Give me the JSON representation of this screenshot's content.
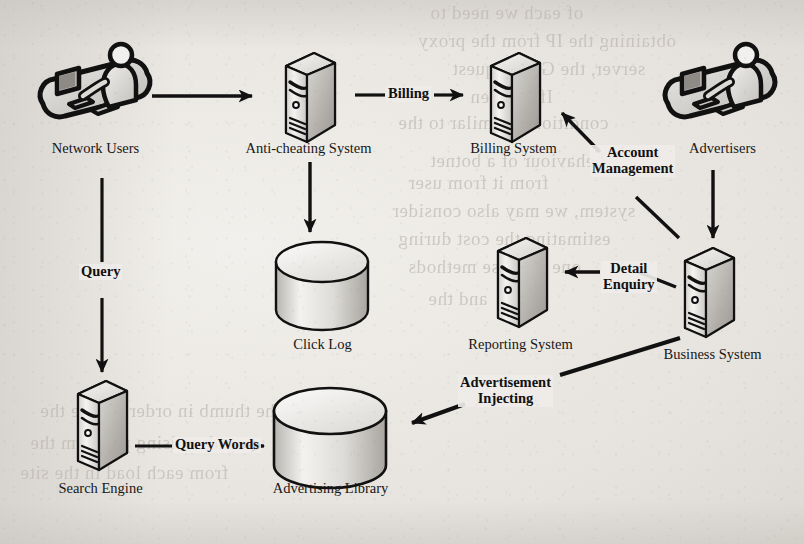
{
  "diagram": {
    "type": "flow-diagram",
    "colors": {
      "stroke": "#111111",
      "fill_light": "#f2f1ef",
      "fill_mid": "#cfcdc9",
      "fill_dark": "#9b9893",
      "paper": "#ebe9e5",
      "text": "#171717"
    },
    "nodes": [
      {
        "id": "network-users",
        "label": "Network Users",
        "icon": "user-at-computer-icon",
        "x": 95,
        "y": 78
      },
      {
        "id": "anti-cheating",
        "label": "Anti-cheating System",
        "icon": "server-tower-icon",
        "x": 308,
        "y": 80
      },
      {
        "id": "billing-system",
        "label": "Billing System",
        "icon": "server-tower-icon",
        "x": 513,
        "y": 80
      },
      {
        "id": "advertisers",
        "label": "Advertisers",
        "icon": "user-at-computer-icon",
        "x": 720,
        "y": 78
      },
      {
        "id": "click-log",
        "label": "Click Log",
        "icon": "database-cylinder-icon",
        "x": 322,
        "y": 292
      },
      {
        "id": "reporting-system",
        "label": "Reporting System",
        "icon": "server-tower-icon",
        "x": 520,
        "y": 290
      },
      {
        "id": "business-system",
        "label": "Business System",
        "icon": "server-tower-icon",
        "x": 707,
        "y": 300
      },
      {
        "id": "search-engine",
        "label": "Search Engine",
        "icon": "server-tower-icon",
        "x": 98,
        "y": 432
      },
      {
        "id": "advertising-library",
        "label": "Advertising Library",
        "icon": "database-cylinder-icon",
        "x": 330,
        "y": 438
      }
    ],
    "edges": [
      {
        "id": "users-to-anticheat",
        "label": "",
        "from": "network-users",
        "to": "anti-cheating"
      },
      {
        "id": "anticheat-to-billing",
        "label": "Billing",
        "from": "anti-cheating",
        "to": "billing-system"
      },
      {
        "id": "anticheat-to-clicklog",
        "label": "",
        "from": "anti-cheating",
        "to": "click-log"
      },
      {
        "id": "users-to-searchengine",
        "label": "Query",
        "from": "network-users",
        "to": "search-engine"
      },
      {
        "id": "advertisers-to-business",
        "label": "",
        "from": "advertisers",
        "to": "business-system"
      },
      {
        "id": "business-to-billing",
        "label": "Account Management",
        "from": "business-system",
        "to": "billing-system"
      },
      {
        "id": "business-to-reporting",
        "label": "Detail Enquiry",
        "from": "business-system",
        "to": "reporting-system"
      },
      {
        "id": "business-to-adlibrary",
        "label": "Advertisement Injecting",
        "from": "business-system",
        "to": "advertising-library"
      },
      {
        "id": "searchengine-to-adlibrary",
        "label": "Query Words",
        "from": "search-engine",
        "to": "advertising-library"
      }
    ],
    "edge_labels": {
      "billing": "Billing",
      "query": "Query",
      "query_words": "Query Words",
      "account_management_line1": "Account",
      "account_management_line2": "Management",
      "detail_enquiry_line1": "Detail",
      "detail_enquiry_line2": "Enquiry",
      "advertisement_injecting_line1": "Advertisement",
      "advertisement_injecting_line2": "Injecting"
    },
    "background_bleed_text": [
      "of each we need to",
      "obtaining the IP from the proxy",
      "server, the GET request",
      "If we then",
      "condition is similar to the",
      "behaviour of a botnet",
      "from it from user",
      "system, we may also consider",
      "estimating the cost during",
      "one of these methods",
      "and the",
      "to the thumb in order to ride the",
      "advertising platform the",
      "from each load in the site"
    ]
  }
}
